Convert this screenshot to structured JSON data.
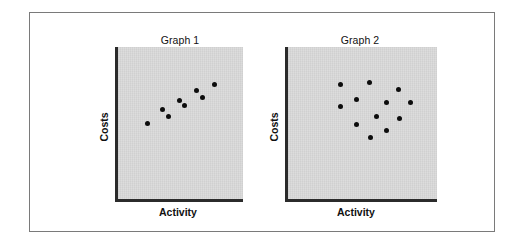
{
  "chart_data": [
    {
      "type": "scatter",
      "title": "Graph 1",
      "xlabel": "Activity",
      "ylabel": "Costs",
      "grid": false,
      "panel": {
        "left": 115,
        "top": 47,
        "right": 243,
        "bottom": 202
      },
      "points_px": [
        [
          147,
          123
        ],
        [
          162.7,
          109.7
        ],
        [
          168.7,
          116.3
        ],
        [
          179,
          100
        ],
        [
          184.3,
          105.7
        ],
        [
          196.3,
          90.7
        ],
        [
          202,
          97.7
        ],
        [
          214,
          84
        ]
      ],
      "description": "Strong positive linear relationship between activity and costs"
    },
    {
      "type": "scatter",
      "title": "Graph 2",
      "xlabel": "Activity",
      "ylabel": "Costs",
      "grid": false,
      "panel": {
        "left": 285,
        "top": 47,
        "right": 437,
        "bottom": 202
      },
      "points_px": [
        [
          340,
          84.3
        ],
        [
          369,
          82.3
        ],
        [
          398.7,
          89.3
        ],
        [
          356.3,
          99.7
        ],
        [
          386,
          102.7
        ],
        [
          410,
          102
        ],
        [
          340.3,
          106.7
        ],
        [
          376,
          116.3
        ],
        [
          399.7,
          118.3
        ],
        [
          356.3,
          124.3
        ],
        [
          386.3,
          130.7
        ],
        [
          370.7,
          137.3
        ]
      ],
      "description": "No apparent relationship between activity and costs"
    }
  ],
  "graphs": [
    {
      "title": "Graph 1",
      "xlabel": "Activity",
      "ylabel": "Costs"
    },
    {
      "title": "Graph 2",
      "xlabel": "Activity",
      "ylabel": "Costs"
    }
  ],
  "colors": {
    "panel": "#d8d8d8",
    "axis": "#2b2b2b",
    "point": "#0d0d0d",
    "frame": "#7a7a7a"
  }
}
